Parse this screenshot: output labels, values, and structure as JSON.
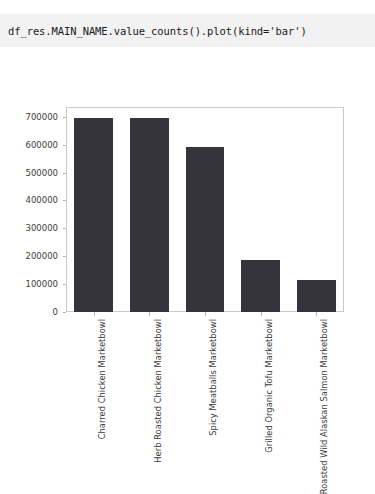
{
  "code_cell": {
    "text": "df_res.MAIN_NAME.value_counts().plot(kind='bar')"
  },
  "colors": {
    "bar": "#34343a",
    "cell_background": "#f2f2f2",
    "axis": "#c9c9c9",
    "tick": "#b5b5b5",
    "text": "#3b3b3b"
  },
  "chart_data": {
    "type": "bar",
    "title": "",
    "xlabel": "",
    "ylabel": "",
    "grid": false,
    "legend": false,
    "ylim": [
      0,
      735000
    ],
    "yticks": [
      0,
      100000,
      200000,
      300000,
      400000,
      500000,
      600000,
      700000
    ],
    "ytick_labels": [
      "0",
      "100000",
      "200000",
      "300000",
      "400000",
      "500000",
      "600000",
      "700000"
    ],
    "categories": [
      "Charred Chicken Marketbowl",
      "Herb Roasted Chicken Marketbowl",
      "Spicy Meatballs Marketbowl",
      "Grilled Organic Tofu Marketbowl",
      "Roasted Wild Alaskan Salmon Marketbowl"
    ],
    "values": [
      695000,
      694000,
      590000,
      186000,
      115000
    ]
  }
}
